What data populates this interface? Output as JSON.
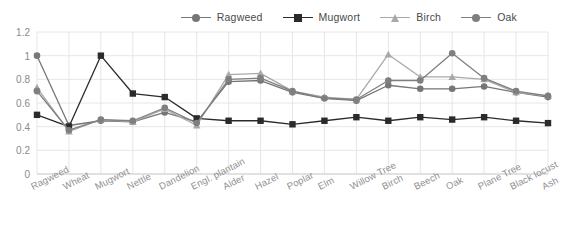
{
  "chart_data": {
    "type": "line",
    "title": "",
    "subtitle": "",
    "xlabel": "",
    "ylabel": "",
    "ylim": [
      0,
      1.2
    ],
    "y_ticks": [
      "0",
      "0.2",
      "0.4",
      "0.6",
      "0.8",
      "1",
      "1.2"
    ],
    "y_tick_values": [
      0,
      0.2,
      0.4,
      0.6,
      0.8,
      1.0,
      1.2
    ],
    "grid": true,
    "legend_position": "top-right",
    "categories": [
      "Ragweed",
      "Wheat",
      "Mugwort",
      "Nettle",
      "Dandelion",
      "Engl. plantain",
      "Alder",
      "Hazel",
      "Poplar",
      "Elm",
      "Willow Tree",
      "Birch",
      "Beech",
      "Oak",
      "Plane Tree",
      "Black locust",
      "Ash"
    ],
    "series": [
      {
        "name": "Ragweed",
        "color": "#767676",
        "marker": "circle",
        "values": [
          1.0,
          0.41,
          0.45,
          0.44,
          0.52,
          0.44,
          0.78,
          0.79,
          0.69,
          0.64,
          0.62,
          0.75,
          0.72,
          0.72,
          0.74,
          0.69,
          0.65
        ]
      },
      {
        "name": "Mugwort",
        "color": "#2b2b2b",
        "marker": "square",
        "values": [
          0.5,
          0.4,
          1.0,
          0.68,
          0.65,
          0.47,
          0.45,
          0.45,
          0.42,
          0.45,
          0.48,
          0.45,
          0.48,
          0.46,
          0.48,
          0.45,
          0.43
        ]
      },
      {
        "name": "Birch",
        "color": "#a9a9a9",
        "marker": "triangle",
        "values": [
          0.73,
          0.36,
          0.46,
          0.44,
          0.55,
          0.41,
          0.84,
          0.85,
          0.7,
          0.65,
          0.63,
          1.01,
          0.82,
          0.82,
          0.8,
          0.69,
          0.66
        ]
      },
      {
        "name": "Oak",
        "color": "#7f7f7f",
        "marker": "circle",
        "values": [
          0.7,
          0.37,
          0.46,
          0.45,
          0.56,
          0.43,
          0.8,
          0.81,
          0.7,
          0.64,
          0.63,
          0.79,
          0.79,
          1.02,
          0.81,
          0.7,
          0.66
        ]
      }
    ]
  },
  "legend": {
    "items": [
      {
        "label": "Ragweed",
        "color": "#767676",
        "marker": "circle"
      },
      {
        "label": "Mugwort",
        "color": "#2b2b2b",
        "marker": "square"
      },
      {
        "label": "Birch",
        "color": "#a9a9a9",
        "marker": "triangle"
      },
      {
        "label": "Oak",
        "color": "#7f7f7f",
        "marker": "circle"
      }
    ]
  },
  "style": {
    "grid_color": "#e6e6e6",
    "axis_label_color": "#8a8a8a",
    "background": "#ffffff"
  }
}
